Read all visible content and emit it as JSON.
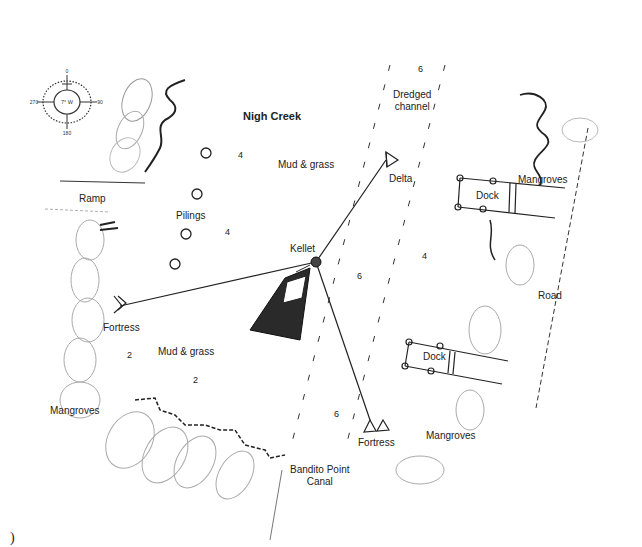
{
  "title": "Nigh Creek",
  "compass": {
    "north": "0",
    "east": "90",
    "south": "180",
    "west": "270",
    "variation": "7° W"
  },
  "labels": {
    "nigh_creek": "Nigh Creek",
    "dredged_channel_line1": "Dredged",
    "dredged_channel_line2": "channel",
    "mud_grass_top": "Mud & grass",
    "mud_grass_bottom": "Mud & grass",
    "ramp": "Ramp",
    "pilings": "Pilings",
    "kellet": "Kellet",
    "delta": "Delta",
    "fortress_left": "Fortress",
    "fortress_bottom": "Fortress",
    "mangroves_top_right": "Mangroves",
    "mangroves_left": "Mangroves",
    "mangroves_bottom_right": "Mangroves",
    "dock_top": "Dock",
    "dock_bottom": "Dock",
    "road": "Road",
    "canal_line1": "Bandito Point",
    "canal_line2": "Canal"
  },
  "depths": {
    "channel_top": "6",
    "near_pilings_top": "4",
    "near_pilings_mid": "4",
    "channel_mid": "6",
    "right_mid": "4",
    "left_shallow": "2",
    "bottom_shallow": "2",
    "channel_bottom": "6"
  },
  "footer_char": ")"
}
